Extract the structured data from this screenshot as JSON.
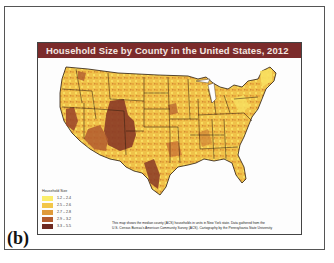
{
  "figure": {
    "label": "(b)",
    "title": "Household Size by County in the United States, 2012"
  },
  "legend": {
    "title": "Household Size",
    "items": [
      {
        "label": "1.2 – 2.4",
        "color": "#fbee6a"
      },
      {
        "label": "2.5 – 2.6",
        "color": "#f2c64a"
      },
      {
        "label": "2.7 – 2.8",
        "color": "#e09a3a"
      },
      {
        "label": "2.9 – 3.2",
        "color": "#b25a2e"
      },
      {
        "label": "3.3 – 5.5",
        "color": "#6e2a22"
      }
    ]
  },
  "note": {
    "line1": "This map shows the median county (ACS) households in units in New York state. Data gathered from the",
    "line2": "U.S. Census Bureau's American Community Survey (ACS). Cartography by the Pennsylvania State University"
  },
  "colors": {
    "title_bar": "#7b2b2b",
    "state_border": "#2a1a0e"
  }
}
